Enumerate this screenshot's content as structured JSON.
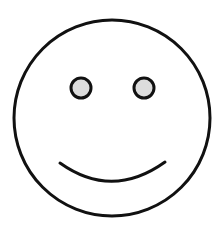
{
  "figure": {
    "colors": {
      "background": "#ffffff",
      "stroke": "#111111",
      "eye_fill": "#dcdcdc",
      "face_fill": "#ffffff"
    },
    "face": {
      "cx": 112,
      "cy": 118,
      "r": 98,
      "stroke_width": 3
    },
    "eyes": [
      {
        "cx": 81,
        "cy": 88,
        "r": 10
      },
      {
        "cx": 144,
        "cy": 88,
        "r": 10
      }
    ],
    "mouth": {
      "x1": 60,
      "y1": 163,
      "cx": 112,
      "cy": 200,
      "x2": 165,
      "y2": 162,
      "stroke_width": 3
    }
  }
}
